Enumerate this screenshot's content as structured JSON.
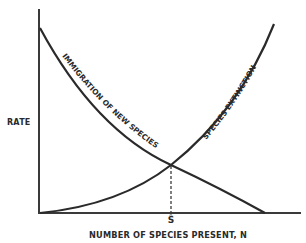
{
  "diagram": {
    "type": "equilibrium-theory-of-island-biogeography",
    "y_axis_label": "RATE",
    "x_axis_label": "NUMBER OF SPECIES PRESENT, N",
    "equilibrium_label": "Ŝ",
    "curves": [
      {
        "name": "immigration",
        "label": "IMMIGRATION OF NEW SPECIES",
        "trend": "decreasing"
      },
      {
        "name": "extinction",
        "label": "SPECIES EXTINCTION",
        "trend": "increasing"
      }
    ],
    "colors": {
      "line": "#2a2a2a",
      "background": "#ffffff"
    }
  }
}
